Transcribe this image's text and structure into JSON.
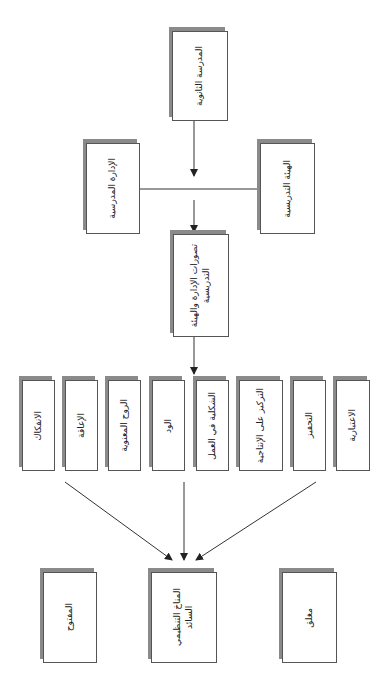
{
  "diagram": {
    "top": {
      "label": "المدرسة الثانوية"
    },
    "middle_left": {
      "label": "الإدارة المدرسية"
    },
    "middle_right": {
      "label": "الهيئة التدريسية"
    },
    "center": {
      "label": "تصورات الإدارة والهيئة\nالتدريسية"
    },
    "dimensions": [
      {
        "label": "الانفكاك"
      },
      {
        "label": "الإعاقة"
      },
      {
        "label": "الروح المعنوية"
      },
      {
        "label": "الود"
      },
      {
        "label": "الشكلية في العمل"
      },
      {
        "label": "التركيز على الإنتاجية"
      },
      {
        "label": "التحفيز"
      },
      {
        "label": "الاعتبارية"
      }
    ],
    "outcomes": {
      "left": {
        "label": "المفتوح"
      },
      "center": {
        "label": "المناخ التنظيمي\nالسائد"
      },
      "right": {
        "label": "مغلق"
      }
    }
  },
  "colors": {
    "line": "#333333",
    "box_border": "#555555",
    "shadow": "#8a8a8a"
  }
}
